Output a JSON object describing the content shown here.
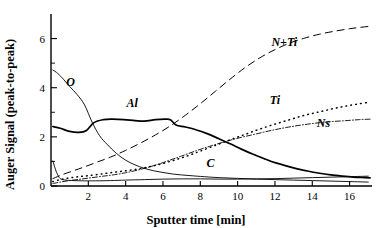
{
  "chart_data": {
    "type": "line",
    "title": "",
    "xlabel": "Sputter time [min]",
    "ylabel": "Auger Signal (peak-to-peak)",
    "xlim": [
      0,
      17.2
    ],
    "ylim": [
      0,
      7.0
    ],
    "grid": false,
    "legend_position": "inline-labels",
    "xticks": [
      2,
      4,
      6,
      8,
      10,
      12,
      14,
      16
    ],
    "xtick_labels": [
      "2",
      "4",
      "6",
      "8",
      "10",
      "12",
      "14",
      "16"
    ],
    "yticks": [
      0,
      2,
      4,
      6
    ],
    "ytick_labels": [
      "0",
      "2",
      "4",
      "6"
    ],
    "yticks_minor": [
      1,
      3,
      5
    ],
    "series": [
      {
        "name": "O",
        "label": "O",
        "style": "solid-thin",
        "color": "#000000",
        "x": [
          0.1,
          0.3,
          0.6,
          1.0,
          1.4,
          1.8,
          2.2,
          2.6,
          3.0,
          3.5,
          4.0,
          4.5,
          5.0,
          5.5,
          6.0,
          6.5,
          7.0,
          7.5,
          8.0,
          9.0,
          10.0,
          11.0,
          12.0,
          13.0,
          14.0,
          15.0,
          16.0,
          17.0
        ],
        "y": [
          4.72,
          4.62,
          4.4,
          4.05,
          3.72,
          3.3,
          2.6,
          2.05,
          1.7,
          1.33,
          1.05,
          0.86,
          0.72,
          0.62,
          0.55,
          0.49,
          0.45,
          0.42,
          0.39,
          0.34,
          0.31,
          0.28,
          0.26,
          0.24,
          0.22,
          0.2,
          0.18,
          0.16
        ]
      },
      {
        "name": "Al",
        "label": "Al",
        "style": "solid-bold",
        "color": "#000000",
        "x": [
          0.1,
          0.5,
          1.0,
          1.5,
          1.9,
          2.3,
          2.8,
          3.3,
          3.9,
          4.5,
          5.0,
          5.6,
          6.1,
          6.4,
          6.7,
          7.2,
          7.8,
          8.4,
          9.0,
          9.6,
          10.2,
          10.8,
          11.4,
          12.0,
          12.6,
          13.2,
          13.8,
          14.4,
          15.0,
          15.6,
          16.2,
          16.8,
          17.1
        ],
        "y": [
          2.42,
          2.35,
          2.22,
          2.18,
          2.26,
          2.58,
          2.7,
          2.72,
          2.7,
          2.66,
          2.64,
          2.7,
          2.72,
          2.7,
          2.48,
          2.4,
          2.28,
          2.12,
          1.92,
          1.72,
          1.5,
          1.3,
          1.12,
          0.95,
          0.82,
          0.7,
          0.6,
          0.52,
          0.45,
          0.4,
          0.36,
          0.34,
          0.33
        ]
      },
      {
        "name": "N+Ti",
        "label": "N+Ti",
        "style": "dashed-long",
        "color": "#000000",
        "x": [
          0.1,
          0.6,
          1.2,
          1.8,
          2.5,
          3.2,
          4.0,
          4.8,
          5.6,
          6.4,
          7.2,
          8.0,
          8.8,
          9.6,
          10.4,
          11.2,
          12.0,
          12.8,
          13.6,
          14.4,
          15.2,
          16.0,
          16.6,
          17.1
        ],
        "y": [
          0.3,
          0.46,
          0.62,
          0.78,
          0.98,
          1.18,
          1.45,
          1.75,
          2.08,
          2.45,
          2.88,
          3.35,
          3.85,
          4.35,
          4.82,
          5.22,
          5.55,
          5.82,
          6.02,
          6.18,
          6.3,
          6.4,
          6.46,
          6.5
        ]
      },
      {
        "name": "Ti",
        "label": "Ti",
        "style": "dotted",
        "color": "#000000",
        "x": [
          0.1,
          0.5,
          1.0,
          1.5,
          2.0,
          2.6,
          3.2,
          3.8,
          4.4,
          5.0,
          5.6,
          6.2,
          6.8,
          7.4,
          8.0,
          8.8,
          9.6,
          10.4,
          11.2,
          12.0,
          12.8,
          13.6,
          14.4,
          15.2,
          16.0,
          16.8,
          17.1
        ],
        "y": [
          0.18,
          0.26,
          0.33,
          0.38,
          0.42,
          0.48,
          0.54,
          0.6,
          0.66,
          0.74,
          0.84,
          0.96,
          1.1,
          1.25,
          1.42,
          1.65,
          1.88,
          2.1,
          2.32,
          2.52,
          2.7,
          2.88,
          3.02,
          3.16,
          3.28,
          3.38,
          3.42
        ]
      },
      {
        "name": "Ns",
        "label": "Ns",
        "style": "dash-dot",
        "color": "#000000",
        "x": [
          0.1,
          0.5,
          1.0,
          1.6,
          2.2,
          2.8,
          3.4,
          4.0,
          4.6,
          5.2,
          5.8,
          6.4,
          7.0,
          7.8,
          8.6,
          9.4,
          10.2,
          11.0,
          11.8,
          12.6,
          13.4,
          14.2,
          15.0,
          15.8,
          16.5,
          17.1
        ],
        "y": [
          0.1,
          0.16,
          0.22,
          0.28,
          0.34,
          0.4,
          0.46,
          0.54,
          0.64,
          0.76,
          0.9,
          1.06,
          1.22,
          1.44,
          1.64,
          1.82,
          1.98,
          2.12,
          2.26,
          2.38,
          2.48,
          2.56,
          2.62,
          2.66,
          2.7,
          2.72
        ]
      },
      {
        "name": "C",
        "label": "C",
        "style": "solid-thin",
        "color": "#000000",
        "x": [
          0.1,
          0.3,
          0.5,
          0.8,
          1.2,
          1.8,
          2.4,
          3.2,
          4.0,
          5.0,
          6.0,
          7.0,
          8.0,
          9.0,
          10.0,
          11.0,
          12.0,
          13.0,
          14.0,
          15.0,
          16.0,
          17.0
        ],
        "y": [
          1.02,
          0.55,
          0.3,
          0.24,
          0.22,
          0.21,
          0.21,
          0.22,
          0.24,
          0.26,
          0.28,
          0.29,
          0.29,
          0.28,
          0.28,
          0.29,
          0.3,
          0.32,
          0.34,
          0.36,
          0.38,
          0.4
        ]
      }
    ],
    "annotations": [
      {
        "text": "O",
        "x": 1.05,
        "y": 4.05
      },
      {
        "text": "Al",
        "x": 4.35,
        "y": 3.22
      },
      {
        "text": "N+Ti",
        "x": 12.5,
        "y": 5.7
      },
      {
        "text": "Ti",
        "x": 12.0,
        "y": 3.35
      },
      {
        "text": "Ns",
        "x": 14.6,
        "y": 2.42
      },
      {
        "text": "C",
        "x": 8.55,
        "y": 0.78
      }
    ]
  }
}
